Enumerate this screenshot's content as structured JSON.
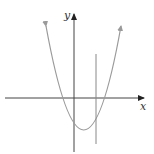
{
  "figure": {
    "axes": {
      "x_label": "x",
      "y_label": "y",
      "color": "#444444"
    },
    "parabola": {
      "color": "#9a9a9a",
      "vertex_px": [
        84,
        130
      ],
      "x_intercepts_px": [
        63,
        104
      ],
      "arms_end_px": [
        [
          45,
          25
        ],
        [
          120,
          25
        ]
      ]
    },
    "vertical_line": {
      "color": "#888888",
      "x_px": 96,
      "y_range_px": [
        54,
        144
      ]
    }
  }
}
